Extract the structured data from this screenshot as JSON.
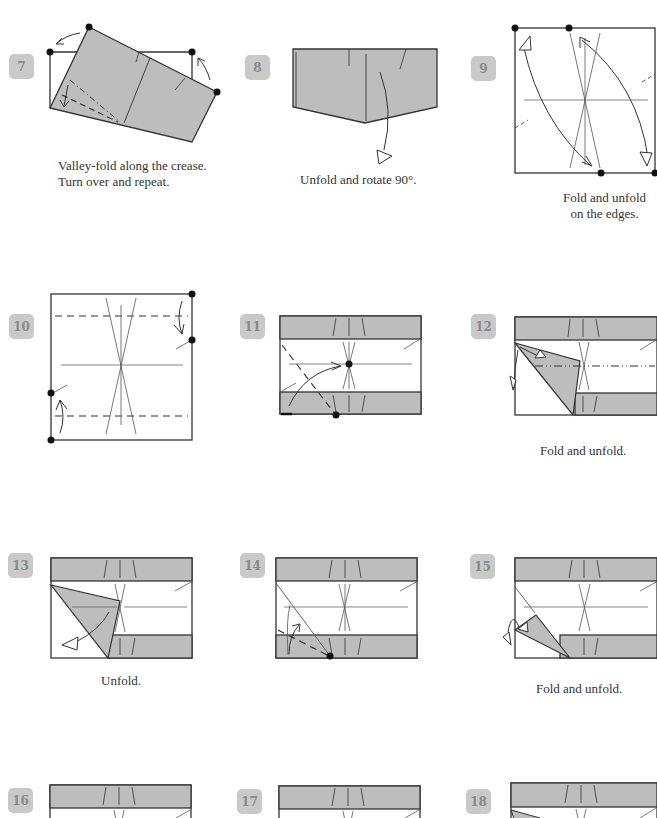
{
  "steps": [
    {
      "number": "7",
      "caption_lines": [
        "Valley-fold along the crease.",
        "Turn over and repeat."
      ]
    },
    {
      "number": "8",
      "caption_lines": [
        "Unfold and rotate 90°."
      ]
    },
    {
      "number": "9",
      "caption_lines": [
        "Fold and unfold",
        "on the edges."
      ]
    },
    {
      "number": "10",
      "caption_lines": []
    },
    {
      "number": "11",
      "caption_lines": []
    },
    {
      "number": "12",
      "caption_lines": [
        "Fold and unfold."
      ]
    },
    {
      "number": "13",
      "caption_lines": [
        "Unfold."
      ]
    },
    {
      "number": "14",
      "caption_lines": []
    },
    {
      "number": "15",
      "caption_lines": [
        "Fold and unfold."
      ]
    },
    {
      "number": "16",
      "caption_lines": []
    },
    {
      "number": "17",
      "caption_lines": []
    },
    {
      "number": "18",
      "caption_lines": []
    }
  ],
  "colors": {
    "paper": "#bdbdbd",
    "line": "#333333",
    "badge": "#c9c9c9",
    "badge_text": "#8a8a8a"
  }
}
